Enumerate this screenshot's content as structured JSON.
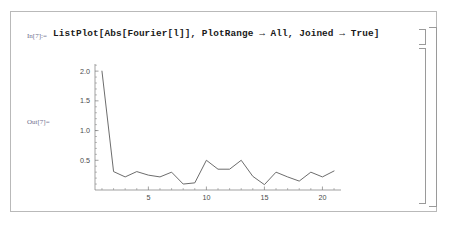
{
  "window": {
    "kind": "mathematica-notebook-cell"
  },
  "input_cell": {
    "prompt": "In[7]:=",
    "code": "ListPlot[Abs[Fourier[l]], PlotRange → All, Joined → True]"
  },
  "output_cell": {
    "prompt": "Out[7]="
  },
  "brackets": {
    "input_bracket": "cell-bracket",
    "output_bracket": "cell-bracket",
    "group_bracket": "cell-group-bracket"
  },
  "colors": {
    "prompt": "#6f6f8e",
    "code": "#1a1a1a",
    "curve": "#5b5b5b",
    "axis": "#7a7a7a",
    "frame": "#b9b9b9",
    "bracket": "#9a9a9a",
    "background": "#ffffff"
  },
  "chart_data": {
    "type": "line",
    "title": "",
    "xlabel": "",
    "ylabel": "",
    "joined": true,
    "grid": false,
    "legend": null,
    "xlim": [
      0.4,
      21.6
    ],
    "ylim": [
      0,
      2.12
    ],
    "xticks": [
      5,
      10,
      15,
      20
    ],
    "xtick_labels": [
      "5",
      "10",
      "15",
      "20"
    ],
    "yticks": [
      0.5,
      1.0,
      1.5,
      2.0
    ],
    "ytick_labels": [
      "0.5",
      "1.0",
      "1.5",
      "2.0"
    ],
    "x": [
      1,
      2,
      3,
      4,
      5,
      6,
      7,
      8,
      9,
      10,
      11,
      12,
      13,
      14,
      15,
      16,
      17,
      18,
      19,
      20,
      21
    ],
    "values": [
      2.0,
      0.31,
      0.22,
      0.31,
      0.25,
      0.22,
      0.3,
      0.1,
      0.12,
      0.5,
      0.35,
      0.35,
      0.5,
      0.23,
      0.09,
      0.3,
      0.22,
      0.15,
      0.3,
      0.22,
      0.32
    ]
  }
}
